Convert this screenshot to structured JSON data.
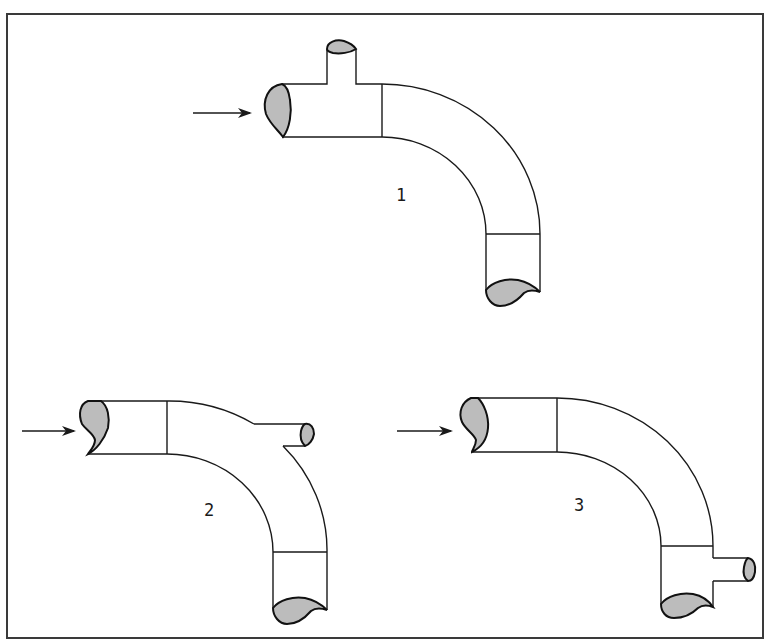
{
  "figure": {
    "frame": {
      "left": 7,
      "top": 14,
      "right": 763,
      "bottom": 638
    },
    "colors": {
      "line": "#1a1a1a",
      "cap_fill": "#bcbcbc",
      "background": "#ffffff"
    },
    "diagrams": [
      {
        "id": 1,
        "label": "1",
        "description": "Pipe elbow with branch tee on straight inlet section (branch pointing up)",
        "flow_arrow": "arrow pointing right into inlet",
        "branch_position": "upstream of elbow, top"
      },
      {
        "id": 2,
        "label": "2",
        "description": "Pipe elbow with branch on outer side of bend (branch pointing right)",
        "flow_arrow": "arrow pointing right into inlet",
        "branch_position": "on elbow outer wall"
      },
      {
        "id": 3,
        "label": "3",
        "description": "Pipe elbow with branch on straight outlet section (branch pointing right)",
        "flow_arrow": "arrow pointing right into inlet",
        "branch_position": "downstream of elbow, right side"
      }
    ]
  }
}
